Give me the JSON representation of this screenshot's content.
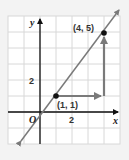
{
  "diagram": {
    "type": "coordinate-plane-slope",
    "axes": {
      "x_label": "x",
      "y_label": "y",
      "origin_label": "O"
    },
    "tick_labels": {
      "x": "2",
      "y": "2"
    },
    "points": [
      {
        "label": "(1, 1)",
        "x": 1,
        "y": 1
      },
      {
        "label": "(4, 5)",
        "x": 4,
        "y": 5
      }
    ],
    "line": {
      "through": [
        [
          1,
          1
        ],
        [
          4,
          5
        ]
      ],
      "color": "#7a7a7a"
    },
    "run_arrow": {
      "from": [
        1,
        1
      ],
      "to": [
        4,
        1
      ],
      "color": "#7a7a7a"
    },
    "rise_arrow": {
      "from": [
        4,
        1
      ],
      "to": [
        4,
        5
      ],
      "color": "#7a7a7a"
    },
    "colors": {
      "grid": "#d8d8d8",
      "background": "#ffffff",
      "axis": "#111111",
      "point": "#111111",
      "page": "#f3f3f3"
    }
  }
}
